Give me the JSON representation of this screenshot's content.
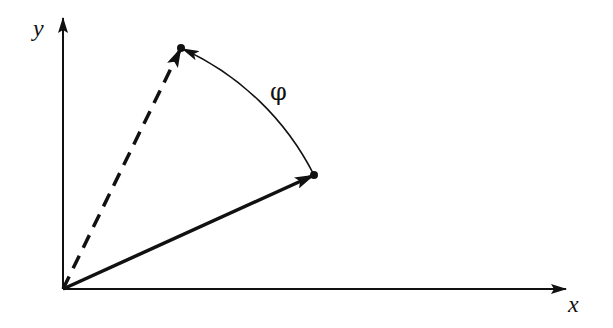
{
  "diagram": {
    "type": "vector-rotation",
    "axes": {
      "x_label": "x",
      "y_label": "y",
      "origin": [
        63,
        289
      ],
      "x_end": [
        566,
        289
      ],
      "y_end": [
        63,
        18
      ]
    },
    "vectors": [
      {
        "name": "original-vector",
        "style": "solid",
        "start": [
          63,
          289
        ],
        "end": [
          314,
          175
        ]
      },
      {
        "name": "rotated-vector",
        "style": "dashed",
        "start": [
          63,
          289
        ],
        "end": [
          181,
          48
        ]
      }
    ],
    "rotation_arc": {
      "from": [
        314,
        175
      ],
      "to": [
        181,
        48
      ],
      "label": "φ"
    },
    "colors": {
      "stroke": "#111111",
      "background": "#ffffff"
    }
  }
}
